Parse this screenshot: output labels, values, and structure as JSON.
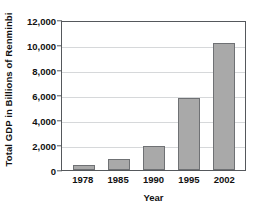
{
  "chart_data": {
    "type": "bar",
    "title": "",
    "categories": [
      "1978",
      "1985",
      "1990",
      "1995",
      "2002"
    ],
    "values": [
      400,
      900,
      1900,
      5800,
      10200
    ],
    "xlabel": "Year",
    "ylabel": "Total GDP in Billions of Renminbi",
    "ylim": [
      0,
      12000
    ],
    "ytick_labels": [
      "0",
      "2,000",
      "4,000",
      "6,000",
      "8,000",
      "10,000",
      "12,000"
    ],
    "ytick_values": [
      0,
      2000,
      4000,
      6000,
      8000,
      10000,
      12000
    ],
    "grid": true,
    "legend": null,
    "bar_color": "#a9a9a9",
    "bar_border_color": "#6f7174",
    "gridline_color": "#d6d8da",
    "axis_color": "#55585c"
  }
}
